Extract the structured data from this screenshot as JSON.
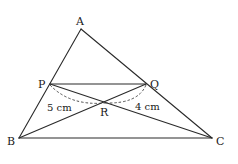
{
  "diagram": {
    "type": "triangle-geometry",
    "points": {
      "A": {
        "label": "A"
      },
      "B": {
        "label": "B"
      },
      "C": {
        "label": "C"
      },
      "P": {
        "label": "P"
      },
      "Q": {
        "label": "Q"
      },
      "R": {
        "label": "R"
      }
    },
    "segments": [
      {
        "id": "AB",
        "from": "A",
        "to": "B",
        "style": "solid"
      },
      {
        "id": "AC",
        "from": "A",
        "to": "C",
        "style": "solid"
      },
      {
        "id": "BC",
        "from": "B",
        "to": "C",
        "style": "solid"
      },
      {
        "id": "PQ",
        "from": "P",
        "to": "Q",
        "style": "solid"
      },
      {
        "id": "BQ",
        "from": "B",
        "to": "Q",
        "style": "solid"
      },
      {
        "id": "PC",
        "from": "P",
        "to": "C",
        "style": "solid"
      }
    ],
    "measurements": [
      {
        "id": "PR",
        "from": "P",
        "to": "R",
        "label": "5 cm",
        "style": "dashed-arc"
      },
      {
        "id": "RQ",
        "from": "R",
        "to": "Q",
        "label": "4 cm",
        "style": "dashed-arc"
      }
    ]
  }
}
